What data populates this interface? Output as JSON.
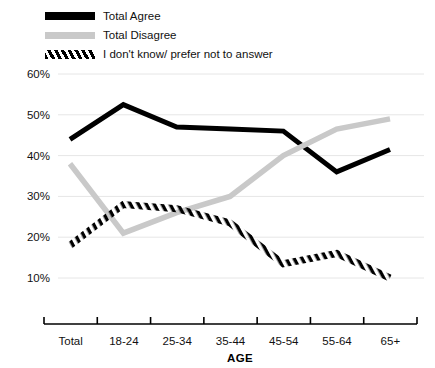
{
  "chart_data": {
    "type": "line",
    "title": "",
    "xlabel": "AGE",
    "ylabel": "",
    "categories": [
      "Total",
      "18-24",
      "25-34",
      "35-44",
      "45-54",
      "55-64",
      "65+"
    ],
    "ylim": [
      5,
      60
    ],
    "ytick_labels": [
      "60%",
      "50%",
      "40%",
      "30%",
      "20%",
      "10%"
    ],
    "yticks": [
      60,
      50,
      40,
      30,
      20,
      10
    ],
    "grid": true,
    "legend_position": "top-left",
    "series": [
      {
        "name": "Total Agree",
        "style": "solid-black",
        "color": "#000000",
        "values": [
          44.0,
          52.5,
          47.0,
          46.5,
          46.0,
          36.0,
          41.5
        ]
      },
      {
        "name": "Total Disagree",
        "style": "solid-gray",
        "color": "#c9c9c9",
        "values": [
          38.0,
          21.0,
          26.0,
          30.0,
          40.0,
          46.5,
          49.0
        ]
      },
      {
        "name": "I don't know/ prefer not to answer",
        "style": "hatched",
        "color": "#000000",
        "values": [
          18.0,
          28.0,
          27.0,
          23.5,
          13.5,
          16.0,
          10.0
        ]
      }
    ]
  },
  "legend": {
    "items": [
      {
        "label": "Total Agree",
        "swatch": "solid-black"
      },
      {
        "label": "Total Disagree",
        "swatch": "solid-gray"
      },
      {
        "label": "I don't know/ prefer not to answer",
        "swatch": "hatched"
      }
    ]
  }
}
